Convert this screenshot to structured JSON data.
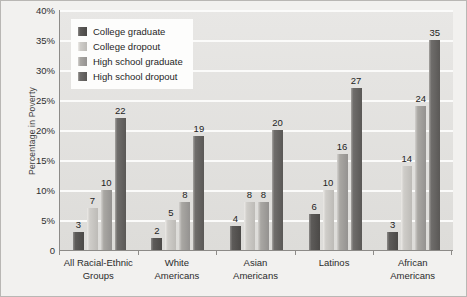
{
  "chart_data": {
    "type": "bar",
    "title": "",
    "subtitle": "",
    "xlabel": "",
    "ylabel": "Percentage in Poverty",
    "ylim": [
      0,
      40
    ],
    "grid": true,
    "legend_position": "top-left",
    "ytick_labels": [
      "40%",
      "35%",
      "30%",
      "25%",
      "20%",
      "15%",
      "10%",
      "5%",
      "0"
    ],
    "ytick_values": [
      40,
      35,
      30,
      25,
      20,
      15,
      10,
      5,
      0
    ],
    "categories": [
      "All Racial-Ethnic Groups",
      "White Americans",
      "Asian Americans",
      "Latinos",
      "African Americans"
    ],
    "category_lines": [
      [
        "All Racial-Ethnic",
        "Groups"
      ],
      [
        "White",
        "Americans"
      ],
      [
        "Asian",
        "Americans"
      ],
      [
        "Latinos"
      ],
      [
        "African",
        "Americans"
      ]
    ],
    "series": [
      {
        "name": "College graduate",
        "color": "#4b4947",
        "values": [
          3,
          2,
          4,
          6,
          3
        ]
      },
      {
        "name": "College dropout",
        "color": "#bdbbb7",
        "values": [
          7,
          5,
          8,
          10,
          14
        ]
      },
      {
        "name": "High school graduate",
        "color": "#949290",
        "values": [
          10,
          8,
          8,
          16,
          24
        ]
      },
      {
        "name": "High school dropout",
        "color": "#5a5856",
        "values": [
          22,
          19,
          20,
          27,
          35
        ]
      }
    ]
  },
  "colors": {
    "plot_background": "#e3e2df",
    "page_background": "#f2f1ef",
    "gridline": "#fbfbfa",
    "axis": "#8d8b88",
    "legend_background": "#fdfdfc",
    "text": "#2b2b2b"
  }
}
